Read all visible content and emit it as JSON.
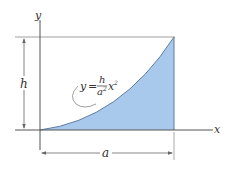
{
  "figure": {
    "axes": {
      "x_label": "x",
      "y_label": "y"
    },
    "dimensions": {
      "height_label": "h",
      "width_label": "a"
    },
    "equation": {
      "lhs": "y",
      "equals": "=",
      "numerator": "h",
      "denominator_base": "a",
      "denominator_exp": "2",
      "var": "x",
      "var_exp": "2"
    },
    "colors": {
      "fill": "#a8c8ec",
      "curve": "#4a6a94",
      "axis": "#555555",
      "line": "#777777"
    }
  }
}
